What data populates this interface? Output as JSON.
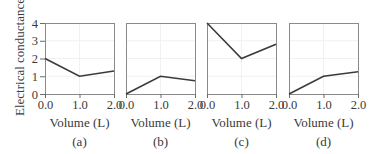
{
  "chart_data": [
    {
      "type": "line",
      "panel": "(a)",
      "x": [
        0.0,
        1.0,
        2.0
      ],
      "values": [
        2.0,
        1.0,
        1.3
      ],
      "xlabel": "Volume (L)",
      "ylabel": "Electrical conductance",
      "xticks": [
        "0.0",
        "1.0",
        "2.0"
      ],
      "yticks": [
        "0",
        "1",
        "2",
        "3",
        "4"
      ],
      "xlim": [
        0,
        2
      ],
      "ylim": [
        0,
        4
      ],
      "grid": true
    },
    {
      "type": "line",
      "panel": "(b)",
      "x": [
        0.0,
        1.0,
        2.0
      ],
      "values": [
        0.0,
        1.0,
        0.75
      ],
      "xlabel": "Volume (L)",
      "xticks": [
        "0.0",
        "1.0",
        "2.0"
      ],
      "xlim": [
        0,
        2
      ],
      "ylim": [
        0,
        4
      ],
      "grid": true
    },
    {
      "type": "line",
      "panel": "(c)",
      "x": [
        0.0,
        1.0,
        2.0
      ],
      "values": [
        4.0,
        2.0,
        2.8
      ],
      "xlabel": "Volume (L)",
      "xticks": [
        "0.0",
        "1.0",
        "2.0"
      ],
      "xlim": [
        0,
        2
      ],
      "ylim": [
        0,
        4
      ],
      "grid": true
    },
    {
      "type": "line",
      "panel": "(d)",
      "x": [
        0.0,
        1.0,
        2.0
      ],
      "values": [
        0.0,
        1.0,
        1.25
      ],
      "xlabel": "Volume (L)",
      "xticks": [
        "0.0",
        "1.0",
        "2.0"
      ],
      "xlim": [
        0,
        2
      ],
      "ylim": [
        0,
        4
      ],
      "grid": true
    }
  ],
  "labels": {
    "ylabel": "Electrical conductance",
    "xlabel": "Volume (L)",
    "yticks": [
      "0",
      "1",
      "2",
      "3",
      "4"
    ],
    "xticks": [
      "0.0",
      "1.0",
      "2.0"
    ],
    "panels": [
      "(a)",
      "(b)",
      "(c)",
      "(d)"
    ]
  }
}
